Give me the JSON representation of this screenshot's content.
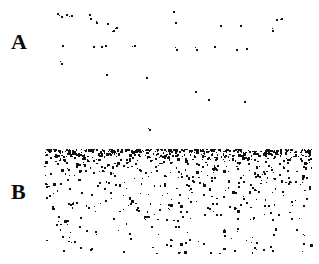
{
  "figure": {
    "width": 319,
    "height": 264,
    "background_color": "#ffffff",
    "dot_color": "#111111",
    "type": "two-panel-scatter-micrograph"
  },
  "panels": [
    {
      "id": "A",
      "label": "A",
      "label_x": 11,
      "label_y": 31,
      "region": {
        "x": 0,
        "y": 0,
        "width": 319,
        "height": 140
      },
      "description": "sparse scattered particles",
      "dot_count": 34
    },
    {
      "id": "B",
      "label": "B",
      "label_x": 11,
      "label_y": 181,
      "region": {
        "x": 0,
        "y": 140,
        "width": 319,
        "height": 124
      },
      "description": "dense particle band at top fading downward",
      "dot_count": 700
    }
  ],
  "chart_data": {
    "type": "scatter",
    "title": "",
    "xlabel": "",
    "ylabel": "",
    "xlim": [
      0,
      319
    ],
    "ylim": [
      0,
      264
    ],
    "grid": false,
    "legend": null,
    "annotations": [
      {
        "text": "A",
        "x": 11,
        "y": 31
      },
      {
        "text": "B",
        "x": 11,
        "y": 181
      }
    ],
    "series": [
      {
        "name": "A",
        "marker": "square",
        "marker_size": 1.6,
        "color": "#111111",
        "points": [
          [
            57,
            13
          ],
          [
            61,
            16
          ],
          [
            66,
            14
          ],
          [
            71,
            15
          ],
          [
            89,
            14
          ],
          [
            90,
            18
          ],
          [
            96,
            22
          ],
          [
            107,
            23
          ],
          [
            113,
            30
          ],
          [
            116,
            27
          ],
          [
            62,
            45
          ],
          [
            93,
            46
          ],
          [
            101,
            46
          ],
          [
            105,
            45
          ],
          [
            134,
            45
          ],
          [
            173,
            11
          ],
          [
            175,
            22
          ],
          [
            176,
            49
          ],
          [
            196,
            49
          ],
          [
            214,
            46
          ],
          [
            220,
            25
          ],
          [
            236,
            49
          ],
          [
            240,
            25
          ],
          [
            246,
            48
          ],
          [
            276,
            19
          ],
          [
            272,
            30
          ],
          [
            61,
            63
          ],
          [
            106,
            74
          ],
          [
            146,
            77
          ],
          [
            149,
            129
          ],
          [
            195,
            91
          ],
          [
            208,
            99
          ],
          [
            244,
            101
          ],
          [
            281,
            18
          ]
        ]
      },
      {
        "name": "B",
        "marker": "square",
        "marker_size": 1.6,
        "color": "#111111",
        "density_profile": {
          "x_range": [
            44,
            311
          ],
          "y_range": [
            149,
            253
          ],
          "top_density": 1.0,
          "bottom_density": 0.18,
          "note": "particle concentration highest in a narrow band at the top of the panel, decaying with depth"
        },
        "point_count": 700
      }
    ]
  }
}
